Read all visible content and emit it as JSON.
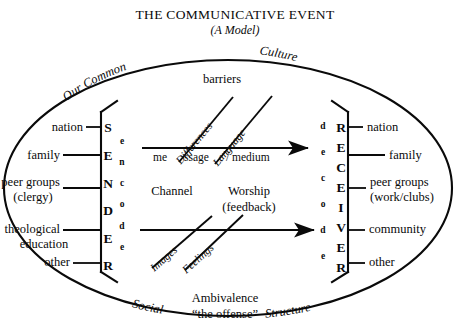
{
  "header": {
    "title": "THE COMMUNICATIVE EVENT",
    "subtitle": "(A Model)"
  },
  "outer_ring": {
    "top_left": "Our Common",
    "top_right": "Culture",
    "bottom_left": "Social",
    "bottom_right": "Structure"
  },
  "sender": {
    "stack_label": [
      "S",
      "E",
      "N",
      "D",
      "E",
      "R"
    ],
    "process_label": [
      "e",
      "n",
      "c",
      "o",
      "d",
      "e"
    ],
    "inputs": [
      "nation",
      "family",
      "peer groups",
      "(clergy)",
      "theological",
      "education",
      "other"
    ]
  },
  "receiver": {
    "stack_label": [
      "R",
      "E",
      "C",
      "E",
      "I",
      "V",
      "E",
      "R"
    ],
    "process_label": [
      "d",
      "e",
      "c",
      "o",
      "d",
      "e"
    ],
    "outputs": [
      "nation",
      "family",
      "peer groups",
      "(work/clubs)",
      "community",
      "other"
    ]
  },
  "channels": {
    "barriers_heading": "barriers",
    "upper": {
      "segment_1": "me",
      "segment_2": "ssage",
      "segment_3": "/ medium",
      "barrier_1": "Differences",
      "barrier_2": "Language"
    },
    "channel_heading": "Channel",
    "feedback_heading_line1": "Worship",
    "feedback_heading_line2": "(feedback)",
    "lower": {
      "barrier_1": "Images",
      "barrier_2": "Feelings"
    }
  },
  "footer": {
    "line1": "Ambivalence",
    "line2": "“the offense”"
  },
  "colors": {
    "ink": "#0a0a0a",
    "paper": "#ffffff"
  }
}
